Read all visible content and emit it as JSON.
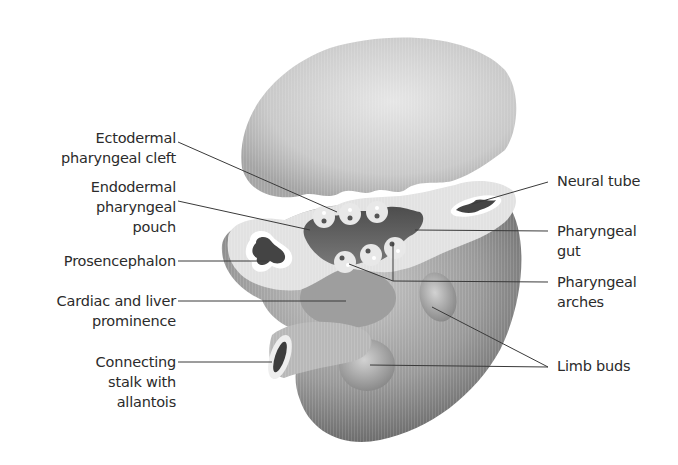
{
  "figure": {
    "labels_left": [
      {
        "id": "ectodermal-pharyngeal-cleft",
        "lines": [
          "Ectodermal",
          "pharyngeal cleft"
        ]
      },
      {
        "id": "endodermal-pharyngeal-pouch",
        "lines": [
          "Endodermal",
          "pharyngeal",
          "pouch"
        ]
      },
      {
        "id": "prosencephalon",
        "lines": [
          "Prosencephalon"
        ]
      },
      {
        "id": "cardiac-and-liver-prominence",
        "lines": [
          "Cardiac and liver",
          "prominence"
        ]
      },
      {
        "id": "connecting-stalk-with-allantois",
        "lines": [
          "Connecting",
          "stalk with",
          "allantois"
        ]
      }
    ],
    "labels_right": [
      {
        "id": "neural-tube",
        "lines": [
          "Neural tube"
        ]
      },
      {
        "id": "pharyngeal-gut",
        "lines": [
          "Pharyngeal",
          "gut"
        ]
      },
      {
        "id": "pharyngeal-arches",
        "lines": [
          "Pharyngeal",
          "arches"
        ]
      },
      {
        "id": "limb-buds",
        "lines": [
          "Limb buds"
        ]
      }
    ],
    "colors": {
      "background": "#ffffff",
      "tissue_light": "#d9d9d9",
      "tissue_mid": "#a8a8a8",
      "tissue_dark": "#5e5e5e",
      "cut_surface": "#e4e4e4",
      "lumen": "#3f3f3f",
      "leader_line": "#3a3a3a",
      "text": "#2b2b2b"
    }
  }
}
